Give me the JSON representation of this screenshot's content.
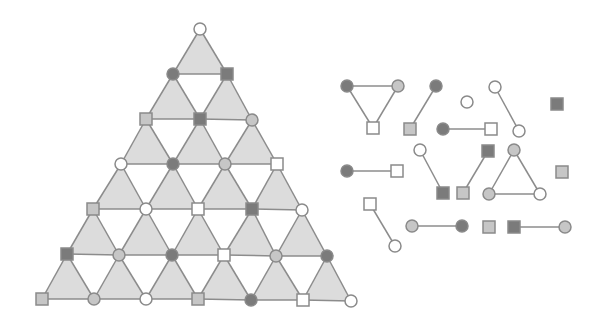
{
  "colors": {
    "background": "#ffffff",
    "triangle_fill": "#dcdcdc",
    "edge": "#8c8c8c",
    "dark": "#7b7b7b",
    "light": "#c6c6c6",
    "white": "#ffffff",
    "stroke": "#8a8a8a"
  },
  "node_size": {
    "circle_r": 6,
    "square": 12
  },
  "lattice": {
    "name": "triangular-lattice",
    "rows": [
      [
        {
          "x": 200,
          "y": 29,
          "shape": "circle",
          "fill": "white"
        }
      ],
      [
        {
          "x": 173,
          "y": 74,
          "shape": "circle",
          "fill": "dark"
        },
        {
          "x": 227,
          "y": 74,
          "shape": "square",
          "fill": "dark"
        }
      ],
      [
        {
          "x": 146,
          "y": 119,
          "shape": "square",
          "fill": "light"
        },
        {
          "x": 200,
          "y": 119,
          "shape": "square",
          "fill": "dark"
        },
        {
          "x": 252,
          "y": 120,
          "shape": "circle",
          "fill": "light"
        }
      ],
      [
        {
          "x": 121,
          "y": 164,
          "shape": "circle",
          "fill": "white"
        },
        {
          "x": 173,
          "y": 164,
          "shape": "circle",
          "fill": "dark"
        },
        {
          "x": 225,
          "y": 164,
          "shape": "circle",
          "fill": "light"
        },
        {
          "x": 277,
          "y": 164,
          "shape": "square",
          "fill": "white"
        }
      ],
      [
        {
          "x": 93,
          "y": 209,
          "shape": "square",
          "fill": "light"
        },
        {
          "x": 146,
          "y": 209,
          "shape": "circle",
          "fill": "white"
        },
        {
          "x": 198,
          "y": 209,
          "shape": "square",
          "fill": "white"
        },
        {
          "x": 252,
          "y": 209,
          "shape": "square",
          "fill": "dark"
        },
        {
          "x": 302,
          "y": 210,
          "shape": "circle",
          "fill": "white"
        }
      ],
      [
        {
          "x": 67,
          "y": 254,
          "shape": "square",
          "fill": "dark"
        },
        {
          "x": 119,
          "y": 255,
          "shape": "circle",
          "fill": "light"
        },
        {
          "x": 172,
          "y": 255,
          "shape": "circle",
          "fill": "dark"
        },
        {
          "x": 224,
          "y": 255,
          "shape": "square",
          "fill": "white"
        },
        {
          "x": 276,
          "y": 256,
          "shape": "circle",
          "fill": "light"
        },
        {
          "x": 327,
          "y": 256,
          "shape": "circle",
          "fill": "dark"
        }
      ],
      [
        {
          "x": 42,
          "y": 299,
          "shape": "square",
          "fill": "light"
        },
        {
          "x": 94,
          "y": 299,
          "shape": "circle",
          "fill": "light"
        },
        {
          "x": 146,
          "y": 299,
          "shape": "circle",
          "fill": "white"
        },
        {
          "x": 198,
          "y": 299,
          "shape": "square",
          "fill": "light"
        },
        {
          "x": 251,
          "y": 300,
          "shape": "circle",
          "fill": "dark"
        },
        {
          "x": 303,
          "y": 300,
          "shape": "square",
          "fill": "white"
        },
        {
          "x": 351,
          "y": 301,
          "shape": "circle",
          "fill": "white"
        }
      ]
    ]
  },
  "components": {
    "name": "disconnected-components",
    "nodes": [
      {
        "id": "a1",
        "x": 347,
        "y": 86,
        "shape": "circle",
        "fill": "dark"
      },
      {
        "id": "a2",
        "x": 398,
        "y": 86,
        "shape": "circle",
        "fill": "light"
      },
      {
        "id": "a3",
        "x": 373,
        "y": 128,
        "shape": "square",
        "fill": "white"
      },
      {
        "id": "b1",
        "x": 436,
        "y": 86,
        "shape": "circle",
        "fill": "dark"
      },
      {
        "id": "b2",
        "x": 410,
        "y": 129,
        "shape": "square",
        "fill": "light"
      },
      {
        "id": "c1",
        "x": 467,
        "y": 102,
        "shape": "circle",
        "fill": "white"
      },
      {
        "id": "d1",
        "x": 495,
        "y": 87,
        "shape": "circle",
        "fill": "white"
      },
      {
        "id": "d2",
        "x": 519,
        "y": 131,
        "shape": "circle",
        "fill": "white"
      },
      {
        "id": "e1",
        "x": 443,
        "y": 129,
        "shape": "circle",
        "fill": "dark"
      },
      {
        "id": "e2",
        "x": 491,
        "y": 129,
        "shape": "square",
        "fill": "white"
      },
      {
        "id": "f1",
        "x": 557,
        "y": 104,
        "shape": "square",
        "fill": "dark"
      },
      {
        "id": "g1",
        "x": 347,
        "y": 171,
        "shape": "circle",
        "fill": "dark"
      },
      {
        "id": "g2",
        "x": 397,
        "y": 171,
        "shape": "square",
        "fill": "white"
      },
      {
        "id": "h1",
        "x": 420,
        "y": 150,
        "shape": "circle",
        "fill": "white"
      },
      {
        "id": "h2",
        "x": 443,
        "y": 193,
        "shape": "square",
        "fill": "dark"
      },
      {
        "id": "i1",
        "x": 488,
        "y": 151,
        "shape": "square",
        "fill": "dark"
      },
      {
        "id": "i2",
        "x": 463,
        "y": 193,
        "shape": "square",
        "fill": "light"
      },
      {
        "id": "j1",
        "x": 514,
        "y": 150,
        "shape": "circle",
        "fill": "light"
      },
      {
        "id": "j2",
        "x": 489,
        "y": 194,
        "shape": "circle",
        "fill": "light"
      },
      {
        "id": "j3",
        "x": 540,
        "y": 194,
        "shape": "circle",
        "fill": "white"
      },
      {
        "id": "k1",
        "x": 562,
        "y": 172,
        "shape": "square",
        "fill": "light"
      },
      {
        "id": "l1",
        "x": 370,
        "y": 204,
        "shape": "square",
        "fill": "white"
      },
      {
        "id": "l2",
        "x": 395,
        "y": 246,
        "shape": "circle",
        "fill": "white"
      },
      {
        "id": "m1",
        "x": 412,
        "y": 226,
        "shape": "circle",
        "fill": "light"
      },
      {
        "id": "m2",
        "x": 462,
        "y": 226,
        "shape": "circle",
        "fill": "dark"
      },
      {
        "id": "n1",
        "x": 489,
        "y": 227,
        "shape": "square",
        "fill": "light"
      },
      {
        "id": "o1",
        "x": 514,
        "y": 227,
        "shape": "square",
        "fill": "dark"
      },
      {
        "id": "o2",
        "x": 565,
        "y": 227,
        "shape": "circle",
        "fill": "light"
      }
    ],
    "edges": [
      [
        "a1",
        "a2"
      ],
      [
        "a1",
        "a3"
      ],
      [
        "a2",
        "a3"
      ],
      [
        "b1",
        "b2"
      ],
      [
        "d1",
        "d2"
      ],
      [
        "e1",
        "e2"
      ],
      [
        "g1",
        "g2"
      ],
      [
        "h1",
        "h2"
      ],
      [
        "i1",
        "i2"
      ],
      [
        "j1",
        "j2"
      ],
      [
        "j1",
        "j3"
      ],
      [
        "j2",
        "j3"
      ],
      [
        "l1",
        "l2"
      ],
      [
        "m1",
        "m2"
      ],
      [
        "o1",
        "o2"
      ]
    ]
  }
}
